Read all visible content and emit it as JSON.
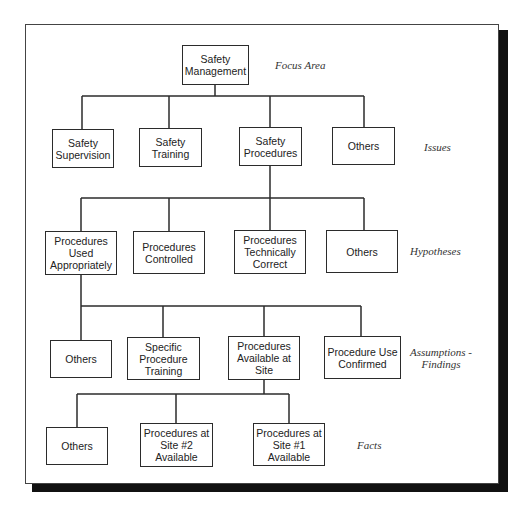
{
  "diagram": {
    "type": "tree",
    "levels": [
      {
        "label": "Focus Area",
        "nodes": [
          {
            "id": "n0",
            "text": "Safety\nManagement"
          }
        ]
      },
      {
        "label": "Issues",
        "parent": "n0",
        "nodes": [
          {
            "id": "n1a",
            "text": "Safety\nSupervision"
          },
          {
            "id": "n1b",
            "text": "Safety\nTraining"
          },
          {
            "id": "n1c",
            "text": "Safety\nProcedures"
          },
          {
            "id": "n1d",
            "text": "Others"
          }
        ]
      },
      {
        "label": "Hypotheses",
        "parent": "n1c",
        "nodes": [
          {
            "id": "n2a",
            "text": "Procedures\nUsed\nAppropriately"
          },
          {
            "id": "n2b",
            "text": "Procedures\nControlled"
          },
          {
            "id": "n2c",
            "text": "Procedures\nTechnically\nCorrect"
          },
          {
            "id": "n2d",
            "text": "Others"
          }
        ]
      },
      {
        "label": "Assumptions -\nFindings",
        "parent": "n2a",
        "nodes": [
          {
            "id": "n3a",
            "text": "Others"
          },
          {
            "id": "n3b",
            "text": "Specific\nProcedure\nTraining"
          },
          {
            "id": "n3c",
            "text": "Procedures\nAvailable at\nSite"
          },
          {
            "id": "n3d",
            "text": "Procedure Use\nConfirmed"
          }
        ]
      },
      {
        "label": "Facts",
        "parent": "n3c",
        "nodes": [
          {
            "id": "n4a",
            "text": "Others"
          },
          {
            "id": "n4b",
            "text": "Procedures at\nSite #2\nAvailable"
          },
          {
            "id": "n4c",
            "text": "Procedures at\nSite #1\nAvailable"
          }
        ]
      }
    ]
  },
  "colors": {
    "line": "#2b2b2b",
    "shadow": "#111111",
    "background": "#ffffff"
  }
}
